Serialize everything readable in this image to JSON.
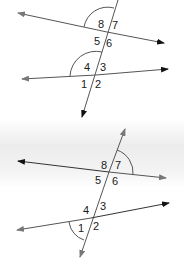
{
  "figures": [
    {
      "id": "top",
      "line_color": "#555555",
      "arrow_color": "#111111",
      "arc_color": "#555555",
      "labels": {
        "a1": "1",
        "a2": "2",
        "a3": "3",
        "a4": "4",
        "a5": "5",
        "a6": "6",
        "a7": "7",
        "a8": "8"
      },
      "marked_angles": [
        "8",
        "4"
      ]
    },
    {
      "id": "bottom",
      "line_color": "#555555",
      "arrow_color": "#777777",
      "arc_color": "#555555",
      "labels": {
        "a1": "1",
        "a2": "2",
        "a3": "3",
        "a4": "4",
        "a5": "5",
        "a6": "6",
        "a7": "7",
        "a8": "8"
      },
      "marked_angles": [
        "7",
        "1"
      ]
    }
  ]
}
